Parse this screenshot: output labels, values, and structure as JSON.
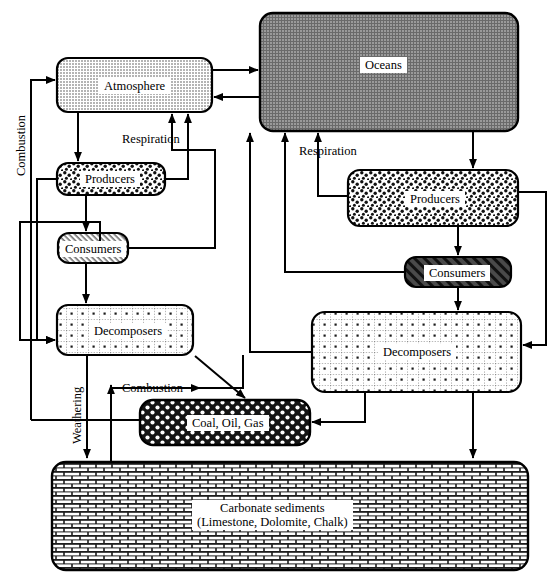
{
  "diagram": {
    "type": "flow-diagram",
    "colors": {
      "stroke": "#000000",
      "atmosphere_fill": "#c9c9c9",
      "oceans_fill": "#8a8a8a",
      "label_bg": "#ffffff",
      "background": "#ffffff"
    },
    "boxes": [
      {
        "id": "atmosphere",
        "label": "Atmosphere",
        "pattern": "light-gray",
        "x": 57,
        "y": 58,
        "w": 155,
        "h": 54
      },
      {
        "id": "oceans",
        "label": "Oceans",
        "pattern": "dark-gray",
        "x": 260,
        "y": 13,
        "w": 258,
        "h": 118
      },
      {
        "id": "land-producers",
        "label": "Producers",
        "pattern": "speckle",
        "x": 57,
        "y": 163,
        "w": 108,
        "h": 32
      },
      {
        "id": "land-consumers",
        "label": "Consumers",
        "pattern": "fine-hatch",
        "x": 58,
        "y": 233,
        "w": 70,
        "h": 30
      },
      {
        "id": "land-decomposers",
        "label": "Decomposers",
        "pattern": "dotted-grid",
        "x": 57,
        "y": 305,
        "w": 136,
        "h": 50
      },
      {
        "id": "ocean-producers",
        "label": "Producers",
        "pattern": "speckle",
        "x": 348,
        "y": 170,
        "w": 170,
        "h": 56
      },
      {
        "id": "ocean-consumers",
        "label": "Consumers",
        "pattern": "diagonal-hatch",
        "x": 405,
        "y": 257,
        "w": 106,
        "h": 30
      },
      {
        "id": "ocean-decomposers",
        "label": "Decomposers",
        "pattern": "dotted-grid",
        "x": 312,
        "y": 312,
        "w": 209,
        "h": 80
      },
      {
        "id": "fossil-fuels",
        "label": "Coal, Oil, Gas",
        "pattern": "dark-checker",
        "x": 140,
        "y": 400,
        "w": 170,
        "h": 45
      },
      {
        "id": "carbonate",
        "label": "Carbonate sediments\n(Limestone, Dolomite, Chalk)",
        "pattern": "brick",
        "x": 52,
        "y": 462,
        "w": 476,
        "h": 108
      }
    ],
    "edge_labels": [
      {
        "id": "combustion-left",
        "text": "Combustion",
        "x": 15,
        "y": 175,
        "orientation": "vertical"
      },
      {
        "id": "respiration-land",
        "text": "Respiration",
        "x": 122,
        "y": 133,
        "orientation": "horizontal"
      },
      {
        "id": "respiration-ocean",
        "text": "Respiration",
        "x": 299,
        "y": 145,
        "orientation": "horizontal"
      },
      {
        "id": "weathering",
        "text": "Weathering",
        "x": 71,
        "y": 442,
        "orientation": "vertical"
      },
      {
        "id": "combustion-lower",
        "text": "Combustion",
        "x": 122,
        "y": 381,
        "orientation": "horizontal"
      }
    ],
    "flows": [
      {
        "from": "atmosphere",
        "to": "oceans",
        "label": ""
      },
      {
        "from": "oceans",
        "to": "atmosphere",
        "label": ""
      },
      {
        "from": "atmosphere",
        "to": "land-producers",
        "label": ""
      },
      {
        "from": "land-producers",
        "to": "atmosphere",
        "label": "Respiration"
      },
      {
        "from": "land-producers",
        "to": "land-consumers",
        "label": ""
      },
      {
        "from": "land-consumers",
        "to": "atmosphere",
        "label": "Respiration"
      },
      {
        "from": "land-consumers",
        "to": "land-decomposers",
        "label": ""
      },
      {
        "from": "land-producers",
        "to": "land-decomposers",
        "label": ""
      },
      {
        "from": "land-decomposers",
        "to": "atmosphere",
        "label": "Respiration"
      },
      {
        "from": "land-decomposers",
        "to": "fossil-fuels",
        "label": ""
      },
      {
        "from": "land-decomposers",
        "to": "carbonate",
        "label": "Weathering"
      },
      {
        "from": "fossil-fuels",
        "to": "atmosphere",
        "label": "Combustion"
      },
      {
        "from": "carbonate",
        "to": "atmosphere",
        "label": "Combustion"
      },
      {
        "from": "oceans",
        "to": "ocean-producers",
        "label": ""
      },
      {
        "from": "ocean-producers",
        "to": "oceans",
        "label": "Respiration"
      },
      {
        "from": "ocean-producers",
        "to": "ocean-consumers",
        "label": ""
      },
      {
        "from": "ocean-consumers",
        "to": "oceans",
        "label": "Respiration"
      },
      {
        "from": "ocean-consumers",
        "to": "ocean-decomposers",
        "label": ""
      },
      {
        "from": "ocean-producers",
        "to": "ocean-decomposers",
        "label": ""
      },
      {
        "from": "ocean-decomposers",
        "to": "fossil-fuels",
        "label": ""
      },
      {
        "from": "ocean-decomposers",
        "to": "carbonate",
        "label": ""
      }
    ]
  }
}
